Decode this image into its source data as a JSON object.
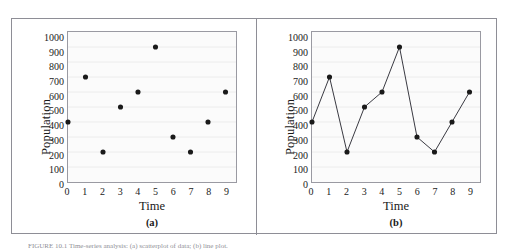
{
  "figure": {
    "caption": "FIGURE 10.1 Time-series analysis: (a) scatterplot of data; (b) line plot."
  },
  "chart_data": [
    {
      "type": "scatter",
      "panel_label": "(a)",
      "title": "",
      "xlabel": "Time",
      "ylabel": "Population",
      "x": [
        0,
        1,
        2,
        3,
        4,
        5,
        6,
        7,
        8,
        9
      ],
      "values": [
        400,
        700,
        200,
        500,
        600,
        900,
        300,
        200,
        400,
        600
      ],
      "xtick_labels": [
        "0",
        "1",
        "2",
        "3",
        "4",
        "5",
        "6",
        "7",
        "8",
        "9"
      ],
      "ytick_labels": [
        "1000",
        "900",
        "800",
        "700",
        "600",
        "500",
        "400",
        "300",
        "200",
        "100",
        "0"
      ],
      "xlim": [
        0,
        9.6
      ],
      "ylim": [
        0,
        1000
      ],
      "grid": true,
      "marker_color": "#1a1a1a",
      "plot_background": "#fbfbfb",
      "legend": "none"
    },
    {
      "type": "line",
      "panel_label": "(b)",
      "title": "",
      "xlabel": "Time",
      "ylabel": "Population",
      "x": [
        0,
        1,
        2,
        3,
        4,
        5,
        6,
        7,
        8,
        9
      ],
      "values": [
        400,
        700,
        200,
        500,
        600,
        900,
        300,
        200,
        400,
        600
      ],
      "xtick_labels": [
        "0",
        "1",
        "2",
        "3",
        "4",
        "5",
        "6",
        "7",
        "8",
        "9"
      ],
      "ytick_labels": [
        "1000",
        "900",
        "800",
        "700",
        "600",
        "500",
        "400",
        "300",
        "200",
        "100",
        "0"
      ],
      "xlim": [
        0,
        9.6
      ],
      "ylim": [
        0,
        1000
      ],
      "grid": true,
      "marker_color": "#1a1a1a",
      "line_color": "#3a3a42",
      "plot_background": "#fbfbfb",
      "legend": "none"
    }
  ]
}
